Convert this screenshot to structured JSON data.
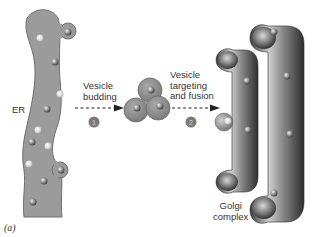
{
  "diagram": {
    "labels": {
      "er": "ER",
      "step1": "Vesicle\nbudding",
      "step1_line1": "Vesicle",
      "step1_line2": "budding",
      "step2_line1": "Vesicle",
      "step2_line2": "targeting",
      "step2_line3": "and fusion",
      "golgi_line1": "Golgi",
      "golgi_line2": "complex",
      "caption": "(a)"
    },
    "step_numbers": [
      "1",
      "2"
    ],
    "colors": {
      "er_fill": "#999999",
      "er_stroke": "#6e6e6e",
      "vesicle_fill": "#8f8f8f",
      "golgi_dark": "#4a4a4a",
      "golgi_light": "#bdbdbd",
      "arrow": "#222222",
      "step_circle": "#7a7a7a"
    }
  }
}
